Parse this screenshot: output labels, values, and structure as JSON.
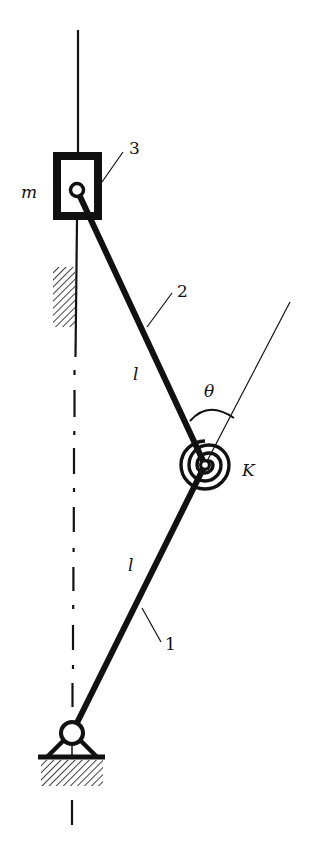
{
  "diagram": {
    "type": "mechanism-schematic",
    "colors": {
      "ink": "#111111",
      "background": "#ffffff"
    },
    "labels": {
      "mass": "m",
      "slider_number": "3",
      "link2_number": "2",
      "link2_length": "l",
      "angle": "θ",
      "spring_stiffness": "K",
      "link1_length": "l",
      "link1_number": "1"
    },
    "components": [
      {
        "id": "1",
        "name": "link 1",
        "length_label": "l"
      },
      {
        "id": "2",
        "name": "link 2",
        "length_label": "l"
      },
      {
        "id": "3",
        "name": "slider block",
        "mass_label": "m"
      },
      {
        "id": "K",
        "name": "torsional spring at middle joint"
      },
      {
        "id": "ground-pivot",
        "name": "fixed pin support"
      },
      {
        "id": "guide",
        "name": "vertical guide with hatched wall"
      }
    ]
  }
}
